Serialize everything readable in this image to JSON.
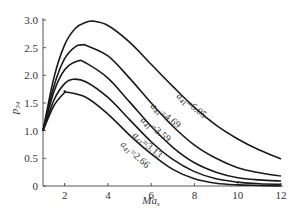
{
  "chart_data": {
    "type": "line",
    "title": "",
    "xlabel": "Ma_s",
    "xlabel_main": "Ma",
    "xlabel_sub": "s",
    "ylabel": "p_34",
    "ylabel_main": "p",
    "ylabel_sub": "34",
    "xlim": [
      1,
      12
    ],
    "ylim": [
      0,
      3.0
    ],
    "xticks": [
      2,
      4,
      6,
      8,
      10,
      12
    ],
    "yticks": [
      0,
      0.5,
      1.0,
      1.5,
      2.0,
      2.5,
      3.0
    ],
    "ytick_labels": [
      "0",
      "0.5",
      "1.0",
      "1.5",
      "2.0",
      "2.5",
      "3.0"
    ],
    "grid": false,
    "legend": "inline labels along curves",
    "series": [
      {
        "name": "a41=6.05",
        "label_main": "a",
        "label_sub": "41",
        "label_value": "=6.05",
        "x": [
          1,
          1.5,
          2,
          2.5,
          3,
          3.3,
          4,
          5,
          6,
          7,
          8,
          9,
          10,
          11,
          12
        ],
        "y": [
          1.0,
          1.95,
          2.55,
          2.85,
          2.96,
          2.98,
          2.9,
          2.6,
          2.2,
          1.8,
          1.42,
          1.1,
          0.85,
          0.65,
          0.49
        ]
      },
      {
        "name": "a41=4.69",
        "label_main": "a",
        "label_sub": "41",
        "label_value": "=4.69",
        "x": [
          1,
          1.5,
          2,
          2.5,
          2.85,
          3,
          4,
          5,
          6,
          7,
          8,
          9,
          10,
          11,
          12
        ],
        "y": [
          1.0,
          1.8,
          2.3,
          2.52,
          2.55,
          2.54,
          2.35,
          1.95,
          1.5,
          1.08,
          0.74,
          0.5,
          0.33,
          0.24,
          0.18
        ]
      },
      {
        "name": "a41=3.59",
        "label_main": "a",
        "label_sub": "41",
        "label_value": "=3.59",
        "x": [
          1,
          1.5,
          2,
          2.6,
          3,
          4,
          5,
          6,
          7,
          8,
          9,
          10,
          11,
          12
        ],
        "y": [
          1.0,
          1.7,
          2.1,
          2.26,
          2.22,
          1.95,
          1.52,
          1.08,
          0.7,
          0.42,
          0.25,
          0.15,
          0.11,
          0.09
        ]
      },
      {
        "name": "a41=3.13",
        "label_main": "a",
        "label_sub": "41",
        "label_value": "=3.13",
        "x": [
          1,
          1.5,
          2,
          2.4,
          3,
          4,
          5,
          6,
          7,
          8,
          9,
          10,
          11,
          12
        ],
        "y": [
          1.0,
          1.55,
          1.85,
          1.93,
          1.88,
          1.6,
          1.2,
          0.8,
          0.48,
          0.26,
          0.13,
          0.07,
          0.04,
          0.03
        ]
      },
      {
        "name": "a41=2.66",
        "label_main": "a",
        "label_sub": "41",
        "label_value": "=2.66",
        "x": [
          1,
          1.5,
          2,
          2.05,
          3,
          4,
          5,
          6,
          7,
          8,
          9,
          10,
          11,
          12
        ],
        "y": [
          1.0,
          1.45,
          1.69,
          1.7,
          1.6,
          1.3,
          0.92,
          0.58,
          0.3,
          0.13,
          0.05,
          0.02,
          0.01,
          0.0
        ]
      }
    ]
  },
  "layout": {
    "plot_left": 43,
    "plot_right": 281,
    "plot_top": 20,
    "plot_bottom": 186,
    "line_color": "#1a1a1a",
    "axis_color": "#555555"
  },
  "labels": [
    {
      "series": 0,
      "x": 176,
      "y": 97,
      "angle": 38
    },
    {
      "series": 1,
      "x": 150,
      "y": 107,
      "angle": 38
    },
    {
      "series": 2,
      "x": 140,
      "y": 121,
      "angle": 38
    },
    {
      "series": 3,
      "x": 132,
      "y": 136,
      "angle": 40
    },
    {
      "series": 4,
      "x": 120,
      "y": 145,
      "angle": 42
    }
  ]
}
